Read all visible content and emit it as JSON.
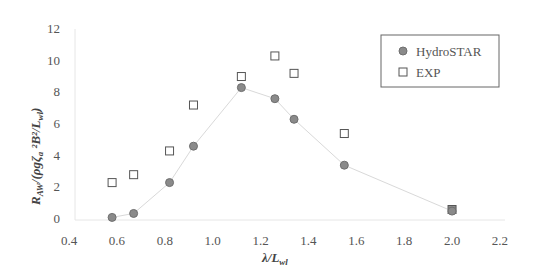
{
  "chart_data": {
    "type": "scatter",
    "title": "",
    "xlabel": "λ/L_wl",
    "ylabel": "R_AW/(ρgζ_a²B²/L_wl)",
    "xlim": [
      0.4,
      2.2
    ],
    "ylim": [
      0,
      12
    ],
    "x_ticks": [
      "0.4",
      "0.6",
      "0.8",
      "1.0",
      "1.2",
      "1.4",
      "1.6",
      "1.8",
      "2.0",
      "2.2"
    ],
    "y_ticks": [
      "0",
      "2",
      "4",
      "6",
      "8",
      "10",
      "12"
    ],
    "grid": false,
    "legend_position": "upper right",
    "series": [
      {
        "name": "HydroSTAR",
        "marker": "circle",
        "color": "#8a8a8a",
        "line": true,
        "line_color": "#d9d9d9",
        "x": [
          0.58,
          0.67,
          0.82,
          0.92,
          1.12,
          1.26,
          1.34,
          1.55,
          2.0
        ],
        "y": [
          0.1,
          0.35,
          2.3,
          4.6,
          8.3,
          7.6,
          6.3,
          3.4,
          0.5
        ]
      },
      {
        "name": "EXP",
        "marker": "square",
        "color": "#555555",
        "line": false,
        "x": [
          0.58,
          0.67,
          0.82,
          0.92,
          1.12,
          1.26,
          1.34,
          1.55,
          2.0
        ],
        "y": [
          2.3,
          2.8,
          4.3,
          7.2,
          9.0,
          10.3,
          9.2,
          5.4,
          0.6
        ]
      }
    ]
  },
  "labels": {
    "x_axis_main": "λ/L",
    "x_axis_sub": "wl",
    "y_axis_R": "R",
    "y_axis_R_sub": "AW",
    "y_axis_rest": "/(ρgζ",
    "y_axis_zeta_sub": "a",
    "y_axis_sq": " ²B²/L",
    "y_axis_L_sub": "wl",
    "y_axis_close": ")"
  },
  "legend": {
    "items": [
      {
        "label": "HydroSTAR",
        "marker": "circle"
      },
      {
        "label": "EXP",
        "marker": "square"
      }
    ]
  }
}
